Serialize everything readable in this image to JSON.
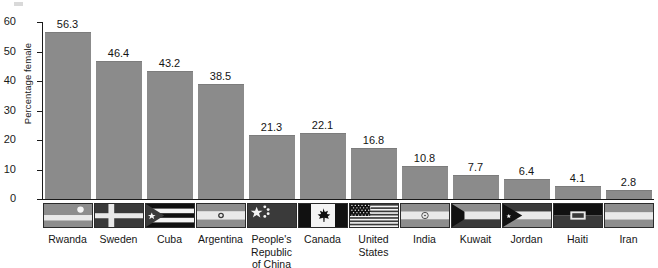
{
  "chart_data": {
    "type": "bar",
    "title": "",
    "subtitle": "",
    "xlabel": "",
    "ylabel": "Percentage female",
    "ylim": [
      0,
      60
    ],
    "yticks": [
      0,
      10,
      20,
      30,
      40,
      50,
      60
    ],
    "ytick_labels": [
      "0",
      "10",
      "20",
      "30",
      "40",
      "50",
      "60"
    ],
    "grid": false,
    "legend": null,
    "bar_color": "#8b8b8b",
    "axis_color": "#1a1a1a",
    "categories": [
      "Rwanda",
      "Sweden",
      "Cuba",
      "Argentina",
      "People's Republic of China",
      "Canada",
      "United States",
      "India",
      "Kuwait",
      "Jordan",
      "Haiti",
      "Iran"
    ],
    "values": [
      56.3,
      46.4,
      43.2,
      38.5,
      21.3,
      22.1,
      16.8,
      10.8,
      7.7,
      6.4,
      4.1,
      2.8
    ],
    "value_labels": [
      "56.3",
      "46.4",
      "43.2",
      "38.5",
      "21.3",
      "22.1",
      "16.8",
      "10.8",
      "7.7",
      "6.4",
      "4.1",
      "2.8"
    ]
  },
  "axis_items": [
    {
      "label": "Rwanda",
      "value_label": "56.3",
      "value": 56.3,
      "flag": "flag-rwanda"
    },
    {
      "label": "Sweden",
      "value_label": "46.4",
      "value": 46.4,
      "flag": "flag-sweden"
    },
    {
      "label": "Cuba",
      "value_label": "43.2",
      "value": 43.2,
      "flag": "flag-cuba"
    },
    {
      "label": "Argentina",
      "value_label": "38.5",
      "value": 38.5,
      "flag": "flag-argentina"
    },
    {
      "label": "People's\nRepublic\nof China",
      "value_label": "21.3",
      "value": 21.3,
      "flag": "flag-china"
    },
    {
      "label": "Canada",
      "value_label": "22.1",
      "value": 22.1,
      "flag": "flag-canada"
    },
    {
      "label": "United\nStates",
      "value_label": "16.8",
      "value": 16.8,
      "flag": "flag-united-states"
    },
    {
      "label": "India",
      "value_label": "10.8",
      "value": 10.8,
      "flag": "flag-india"
    },
    {
      "label": "Kuwait",
      "value_label": "7.7",
      "value": 7.7,
      "flag": "flag-kuwait"
    },
    {
      "label": "Jordan",
      "value_label": "6.4",
      "value": 6.4,
      "flag": "flag-jordan"
    },
    {
      "label": "Haiti",
      "value_label": "4.1",
      "value": 4.1,
      "flag": "flag-haiti"
    },
    {
      "label": "Iran",
      "value_label": "2.8",
      "value": 2.8,
      "flag": "flag-iran"
    }
  ]
}
